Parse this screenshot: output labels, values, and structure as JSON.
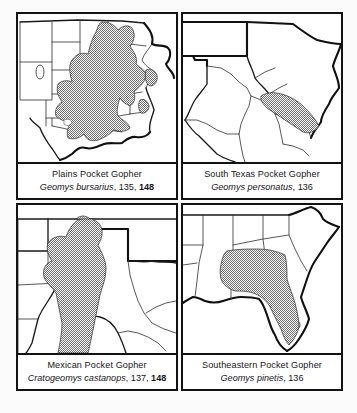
{
  "plate": {
    "title": "Pocket Gopher Range Maps",
    "layout": "2x2 grid of range-map panels",
    "range_fill_color": "#8c8c8c",
    "range_pattern": "50% stipple / dither gray",
    "outline_color": "#101010",
    "background_color": "#fbfbfc",
    "panels": [
      {
        "id": "plains-pocket-gopher",
        "position": "top-left",
        "common_name": "Plains Pocket Gopher",
        "genus_species": "Geomys bursarius",
        "page_refs": "135,",
        "page_ref_bold": "148",
        "map_region": "Central United States / Great Plains",
        "range_description": "Great Plains from Minnesota, Wisconsin and the Dakotas south through Nebraska, Kansas, Oklahoma and eastern Texas to the Gulf Coast; disjunct areas in Illinois, Indiana and Louisiana"
      },
      {
        "id": "south-texas-pocket-gopher",
        "position": "top-right",
        "common_name": "South Texas Pocket Gopher",
        "genus_species": "Geomys personatus",
        "page_refs": "136",
        "page_ref_bold": "",
        "map_region": "Texas and northern Mexico",
        "range_description": "Southern Texas coastal plain from the lower Rio Grande Valley northeast toward the central Gulf Coast"
      },
      {
        "id": "mexican-pocket-gopher",
        "position": "bottom-left",
        "common_name": "Mexican Pocket Gopher",
        "genus_species": "Cratogeomys castanops",
        "page_refs": "137,",
        "page_ref_bold": "148",
        "map_region": "Southwestern United States and northern Mexico",
        "range_description": "Southeastern Colorado and western Kansas south through the Texas and New Mexico panhandle region into the Mexican plateau"
      },
      {
        "id": "southeastern-pocket-gopher",
        "position": "bottom-right",
        "common_name": "Southeastern Pocket Gopher",
        "genus_species": "Geomys pinetis",
        "page_refs": "136",
        "page_ref_bold": "",
        "map_region": "Southeastern United States",
        "range_description": "Southern Alabama and Georgia through most of Florida except the southern tip"
      }
    ]
  }
}
